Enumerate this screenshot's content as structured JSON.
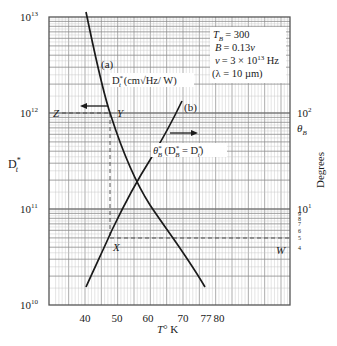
{
  "chart_data": {
    "type": "line",
    "title": "",
    "xlabel": "T° K",
    "ylabel_left": "D*_t",
    "ylabel_right": "Degrees",
    "right_axis_symbol": "θ_B",
    "xlim": [
      31,
      105
    ],
    "ylim_left": [
      10000000000.0,
      10000000000000.0
    ],
    "ylim_right": [
      1,
      1000
    ],
    "yscale": "log",
    "grid": true,
    "x_ticks": [
      {
        "value": 40,
        "label": "40",
        "px": 85
      },
      {
        "value": 50,
        "label": "50",
        "px": 117
      },
      {
        "value": 60,
        "label": "60",
        "px": 148
      },
      {
        "value": 70,
        "label": "70",
        "px": 183
      },
      {
        "value": 77,
        "label": "77",
        "px": 206
      },
      {
        "value": 80,
        "label": "80",
        "px": 219
      }
    ],
    "left_ticks": [
      {
        "base": "10",
        "exp": "13",
        "value": 10000000000000.0
      },
      {
        "base": "10",
        "exp": "12",
        "value": 1000000000000.0
      },
      {
        "base": "10",
        "exp": "11",
        "value": 100000000000.0
      },
      {
        "base": "10",
        "exp": "10",
        "value": 10000000000.0
      }
    ],
    "right_ticks": [
      {
        "base": "10",
        "exp": "2",
        "value": 100
      },
      {
        "base": "10",
        "exp": "1",
        "value": 10
      }
    ],
    "right_minor_ticks": [
      "9",
      "8",
      "7",
      "6",
      "5",
      "4"
    ],
    "series": [
      {
        "name": "(a)",
        "label": "D*_t (cm√Hz/W)",
        "axis": "left",
        "points": [
          [
            40,
            11500000000000.0
          ],
          [
            45,
            3000000000000.0
          ],
          [
            48,
            1050000000000.0
          ],
          [
            55,
            260000000000.0
          ],
          [
            57,
            170000000000.0
          ],
          [
            62,
            90000000000.0
          ],
          [
            70,
            36000000000.0
          ],
          [
            76.5,
            20000000000.0
          ]
        ]
      },
      {
        "name": "(b)",
        "label": "θ*_B (D*_B = D*_t)",
        "axis": "right",
        "points": [
          [
            40,
            1.7
          ],
          [
            45,
            3.2
          ],
          [
            48,
            5.0
          ],
          [
            52,
            9.5
          ],
          [
            57,
            17
          ],
          [
            62,
            36
          ],
          [
            67,
            80
          ],
          [
            70,
            160
          ]
        ]
      }
    ],
    "annotations": {
      "params": [
        "T_B = 300",
        "B = 0.13ν",
        "ν = 3 × 10^13 Hz",
        "(λ = 10 µm)"
      ],
      "point_labels": {
        "Z": "Z",
        "Y": "Y",
        "X": "X",
        "W": "W"
      },
      "dashed_lines": [
        {
          "from": "Z",
          "to": "Y",
          "value": "D*_t = 10^12"
        },
        {
          "from": "Y",
          "to": "X",
          "value": "T ≈ 48 K"
        },
        {
          "from": "X",
          "to": "W",
          "value": "θ_B ≈ 5°"
        }
      ],
      "arrows": [
        {
          "for": "(a)",
          "direction": "left"
        },
        {
          "for": "(b)",
          "direction": "right"
        }
      ]
    }
  },
  "text": {
    "params": {
      "tb": "= 300",
      "b_pre": "B",
      "b_val": "= 0.13",
      "nu_val": "= 3 × 10",
      "nu_exp": "13",
      "nu_unit": " Hz",
      "lambda": "(λ = 10 µm)"
    },
    "curve_a_label": "(a)",
    "curve_b_label": "(b)",
    "dt_label_unit": " (cm√Hz/ W)",
    "theta_label_tail": " = D",
    "x_title_T": "T",
    "x_title_unit": "° K",
    "left_title": "D",
    "right_title": "Degrees",
    "right_symbol": "θ",
    "Z": "Z",
    "Y": "Y",
    "X": "X",
    "W": "W"
  },
  "colors": {
    "grid_major": "#8a8a8a",
    "grid_minor": "#c4c4c4",
    "curve": "#1a1a1a",
    "frame": "#555555"
  }
}
